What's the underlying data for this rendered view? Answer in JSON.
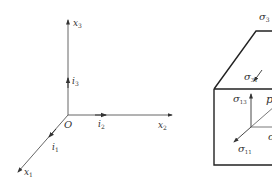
{
  "left_figure": {
    "origin_label": "O",
    "axes": [
      {
        "name": "x",
        "sub": "3",
        "unit": "i",
        "unit_sub": "3"
      },
      {
        "name": "x",
        "sub": "2",
        "unit": "i",
        "unit_sub": "2"
      },
      {
        "name": "x",
        "sub": "1",
        "unit": "i",
        "unit_sub": "1"
      }
    ]
  },
  "right_figure": {
    "labels": {
      "sigma33": {
        "sym": "σ",
        "sub": "3"
      },
      "sigma31": {
        "sym": "σ",
        "sub": "31"
      },
      "sigma13": {
        "sym": "σ",
        "sub": "13"
      },
      "p": {
        "sym": "p"
      },
      "sigma11": {
        "sym": "σ",
        "sub": "11"
      },
      "sigma_partial": {
        "sym": "σ"
      }
    }
  },
  "colors": {
    "stroke": "#333333",
    "box": "#222222"
  }
}
